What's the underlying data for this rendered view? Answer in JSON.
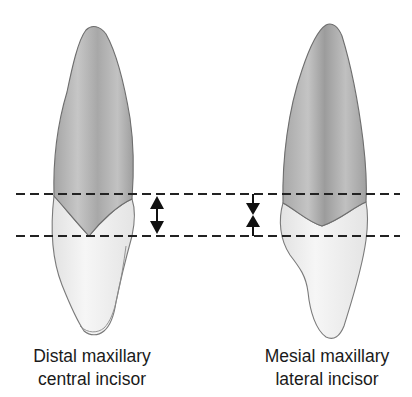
{
  "figure": {
    "left_tooth": {
      "caption_line1": "Distal maxillary",
      "caption_line2": "central incisor",
      "arrow_type": "double-headed"
    },
    "right_tooth": {
      "caption_line1": "Mesial maxillary",
      "caption_line2": "lateral incisor",
      "arrow_type": "converging"
    },
    "reference_lines": {
      "style": "dashed",
      "count": 2
    },
    "colors": {
      "root": "#b3b3b3",
      "crown": "#ececec",
      "outline": "#7a7a7a",
      "line": "#222222"
    }
  }
}
